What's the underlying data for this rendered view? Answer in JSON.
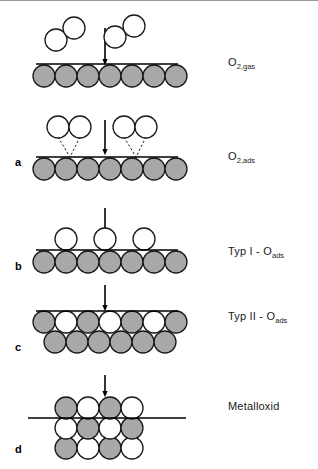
{
  "figure": {
    "background": "#ffffff",
    "width": 318,
    "height": 469,
    "top_rule": true
  },
  "colors": {
    "metal_atom_fill": "#a8a8a8",
    "oxygen_atom_fill": "#ffffff",
    "atom_stroke": "#1a1a1a",
    "surface_line": "#000000",
    "arrow": "#000000",
    "dashed_bond": "#1a1a1a",
    "label_text": "#1a1a1a",
    "top_rule": "#9a9a9a"
  },
  "right_labels": [
    {
      "id": "o2-gas",
      "base": "O",
      "sub": "2,gas",
      "x": 228,
      "y": 56
    },
    {
      "id": "o2-ads",
      "base": "O",
      "sub": "2,ads",
      "x": 228,
      "y": 150
    },
    {
      "id": "typ1",
      "base": "Typ I - O",
      "sub": "ads",
      "x": 228,
      "y": 245
    },
    {
      "id": "typ2",
      "base": "Typ II - O",
      "sub": "ads",
      "x": 228,
      "y": 310
    },
    {
      "id": "metalloxid",
      "base": "Metalloxid",
      "sub": "",
      "x": 228,
      "y": 400
    }
  ],
  "panel_letters": [
    {
      "id": "a",
      "label": "a",
      "x": 15,
      "y": 156
    },
    {
      "id": "b",
      "label": "b",
      "x": 15,
      "y": 260
    },
    {
      "id": "c",
      "label": "c",
      "x": 15,
      "y": 341
    },
    {
      "id": "d",
      "label": "d",
      "x": 15,
      "y": 443
    }
  ],
  "stages": [
    {
      "id": "stage-gas",
      "name": "o2-gas-approaching-surface",
      "surface_line": {
        "x1": 36,
        "x2": 178,
        "y": 64
      },
      "metal_row": {
        "y": 76,
        "x_start": 44,
        "count": 7,
        "spacing": 22,
        "r": 11
      },
      "o2_molecules": [
        {
          "id": "o2-left",
          "a": {
            "cx": 56,
            "cy": 40,
            "r": 11
          },
          "b": {
            "cx": 74,
            "cy": 28,
            "r": 11
          }
        },
        {
          "id": "o2-right",
          "a": {
            "cx": 115,
            "cy": 37,
            "r": 11
          },
          "b": {
            "cx": 134,
            "cy": 26,
            "r": 11
          }
        }
      ],
      "arrow": {
        "x": 105,
        "y1": 28,
        "y2": 62
      }
    },
    {
      "id": "stage-ads",
      "name": "o2-adsorbed-on-surface",
      "surface_line": {
        "x1": 36,
        "x2": 178,
        "y": 157
      },
      "metal_row": {
        "y": 169,
        "x_start": 44,
        "count": 7,
        "spacing": 22,
        "r": 11
      },
      "o2_molecules": [
        {
          "id": "o2-ads-left",
          "a": {
            "cx": 58,
            "cy": 127,
            "r": 11
          },
          "b": {
            "cx": 80,
            "cy": 127,
            "r": 11
          },
          "anchor_x": 70,
          "anchor_y": 157
        },
        {
          "id": "o2-ads-right",
          "a": {
            "cx": 124,
            "cy": 127,
            "r": 11
          },
          "b": {
            "cx": 146,
            "cy": 127,
            "r": 11
          },
          "anchor_x": 136,
          "anchor_y": 157
        }
      ],
      "arrow": {
        "x": 105,
        "y1": 120,
        "y2": 152
      }
    },
    {
      "id": "stage-typ1",
      "name": "typ-1-oxygen-adatoms",
      "surface_line": {
        "x1": 36,
        "x2": 178,
        "y": 250
      },
      "metal_row": {
        "y": 262,
        "x_start": 44,
        "count": 7,
        "spacing": 22,
        "r": 11
      },
      "adatoms": [
        {
          "cx": 66,
          "cy": 239,
          "r": 11
        },
        {
          "cx": 105,
          "cy": 239,
          "r": 11
        },
        {
          "cx": 144,
          "cy": 239,
          "r": 11
        }
      ],
      "arrow": {
        "x": 105,
        "y1": 208,
        "y2": 236
      }
    },
    {
      "id": "stage-typ2",
      "name": "typ-2-oxygen-incorporated",
      "surface_line": {
        "x1": 36,
        "x2": 178,
        "y": 311
      },
      "rows": [
        {
          "y": 322,
          "x_start": 44,
          "r": 11,
          "fills": [
            "metal",
            "oxygen",
            "metal",
            "oxygen",
            "metal",
            "oxygen",
            "metal"
          ]
        },
        {
          "y": 342,
          "x_start": 55,
          "r": 11,
          "fills": [
            "metal",
            "metal",
            "metal",
            "metal",
            "metal",
            "metal"
          ]
        }
      ],
      "arrow": {
        "x": 105,
        "y1": 285,
        "y2": 308
      }
    },
    {
      "id": "stage-oxide",
      "name": "metal-oxide-lattice",
      "surface_line": {
        "x1": 28,
        "x2": 186,
        "y": 418
      },
      "rows": [
        {
          "y": 408,
          "x_start": 66,
          "r": 11,
          "fills": [
            "metal",
            "oxygen",
            "metal",
            "oxygen"
          ]
        },
        {
          "y": 428,
          "x_start": 66,
          "r": 11,
          "fills": [
            "oxygen",
            "metal",
            "oxygen",
            "metal"
          ]
        },
        {
          "y": 448,
          "x_start": 66,
          "r": 11,
          "fills": [
            "metal",
            "oxygen",
            "metal",
            "oxygen"
          ]
        }
      ],
      "arrow": {
        "x": 105,
        "y1": 375,
        "y2": 394
      }
    }
  ],
  "geometry": {
    "atom_spacing": 22,
    "atom_radius": 11,
    "surface_stroke_width": 1.6,
    "atom_stroke_width": 1.3,
    "arrow_stroke_width": 1.6,
    "arrow_head_size": 5,
    "dash_pattern": "2.2,2.2"
  }
}
